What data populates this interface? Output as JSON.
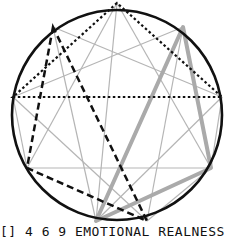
{
  "diagram": {
    "circle": {
      "cx": 117,
      "cy": 115,
      "r": 105,
      "color": "#111111"
    },
    "points": {
      "p_top": [
        117,
        3
      ],
      "p_ul": [
        53,
        27
      ],
      "p_ur": [
        183,
        27
      ],
      "p_l": [
        13,
        97
      ],
      "p_r": [
        222,
        97
      ],
      "p_ll": [
        27,
        168
      ],
      "p_lr": [
        211,
        168
      ],
      "p_bl": [
        96,
        221
      ],
      "p_br": [
        147,
        221
      ]
    },
    "triangles": [
      {
        "name": "dotted-triangle",
        "style": "dotted",
        "color": "#111111",
        "points": [
          "p_top",
          "p_l",
          "p_r"
        ]
      },
      {
        "name": "dashed-triangle",
        "style": "dashed",
        "color": "#111111",
        "points": [
          "p_ul",
          "p_ll",
          "p_br"
        ]
      },
      {
        "name": "thick-gray-triangle",
        "style": "thick",
        "color": "#aaaaaa",
        "points": [
          "p_ur",
          "p_lr",
          "p_bl"
        ]
      }
    ],
    "thin_line_color": "#b5b5b5"
  },
  "caption": "[] 4 6 9 EMOTIONAL REALNESS"
}
